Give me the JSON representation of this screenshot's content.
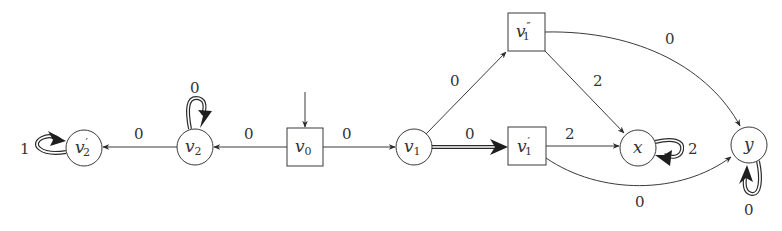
{
  "diagram": {
    "type": "game-graph",
    "nodes": [
      {
        "id": "v2p",
        "base": "v",
        "sub": "2",
        "prime": "′",
        "shape": "circle",
        "cx": 84,
        "cy": 148
      },
      {
        "id": "v2",
        "base": "v",
        "sub": "2",
        "prime": "",
        "shape": "circle",
        "cx": 195,
        "cy": 147
      },
      {
        "id": "v0",
        "base": "v",
        "sub": "0",
        "prime": "",
        "shape": "box",
        "cx": 305,
        "cy": 147
      },
      {
        "id": "v1",
        "base": "v",
        "sub": "1",
        "prime": "",
        "shape": "circle",
        "cx": 414,
        "cy": 147
      },
      {
        "id": "v1pp",
        "base": "v",
        "sub": "1",
        "prime": "″",
        "shape": "box",
        "cx": 527,
        "cy": 32
      },
      {
        "id": "v1p",
        "base": "v",
        "sub": "1",
        "prime": "′",
        "shape": "box",
        "cx": 527,
        "cy": 146
      },
      {
        "id": "x",
        "base": "x",
        "sub": "",
        "prime": "",
        "shape": "circle",
        "cx": 638,
        "cy": 148
      },
      {
        "id": "y",
        "base": "y",
        "sub": "",
        "prime": "",
        "shape": "circle",
        "cx": 749,
        "cy": 145
      }
    ],
    "edges": [
      {
        "from": "v0",
        "to": "v2",
        "weight": "0",
        "style": "single"
      },
      {
        "from": "v2",
        "to": "v2p",
        "weight": "0",
        "style": "single"
      },
      {
        "from": "v0",
        "to": "v1",
        "weight": "0",
        "style": "single"
      },
      {
        "from": "v1",
        "to": "v1pp",
        "weight": "0",
        "style": "single"
      },
      {
        "from": "v1",
        "to": "v1p",
        "weight": "0",
        "style": "double"
      },
      {
        "from": "v1pp",
        "to": "x",
        "weight": "2",
        "style": "single"
      },
      {
        "from": "v1pp",
        "to": "y",
        "weight": "0",
        "style": "single-curved"
      },
      {
        "from": "v1p",
        "to": "x",
        "weight": "2",
        "style": "single"
      },
      {
        "from": "v1p",
        "to": "y",
        "weight": "0",
        "style": "single-curved"
      },
      {
        "from": "v2p",
        "to": "v2p",
        "weight": "1",
        "style": "double-loop"
      },
      {
        "from": "v2",
        "to": "v2",
        "weight": "0",
        "style": "double-loop"
      },
      {
        "from": "x",
        "to": "x",
        "weight": "2",
        "style": "double-loop"
      },
      {
        "from": "y",
        "to": "y",
        "weight": "0",
        "style": "double-loop"
      }
    ],
    "initial_node": "v0",
    "labels": {
      "v2p_loop": "1",
      "v2_loop": "0",
      "v2_v2p": "0",
      "v0_v2": "0",
      "v0_v1": "0",
      "v1_v1pp": "0",
      "v1_v1p": "0",
      "v1pp_x": "2",
      "v1pp_y": "0",
      "v1p_x": "2",
      "v1p_y": "0",
      "x_loop": "2",
      "y_loop": "0"
    },
    "colors": {
      "stroke": "#3a3a3a",
      "text": "#333333",
      "background": "#ffffff"
    }
  }
}
